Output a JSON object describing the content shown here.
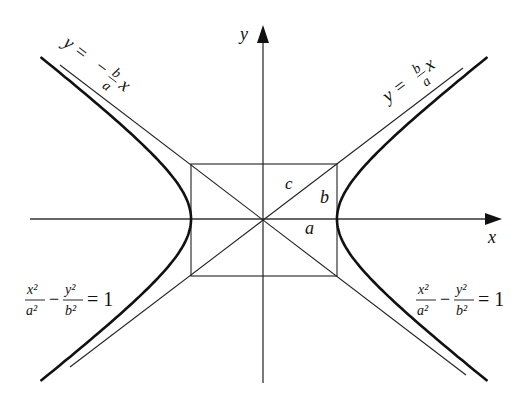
{
  "diagram": {
    "type": "hyperbola",
    "center": {
      "x": 264,
      "y": 219
    },
    "a": 73,
    "b": 56,
    "axes": {
      "x_label": "x",
      "y_label": "y"
    },
    "triangle_labels": {
      "hypotenuse": "c",
      "vertical": "b",
      "horizontal": "a"
    },
    "asymptotes": {
      "positive": {
        "lhs": "y =",
        "num": "b",
        "den": "a",
        "var": "x"
      },
      "negative": {
        "lhs": "y =",
        "sign": "−",
        "num": "b",
        "den": "a",
        "var": "x"
      }
    },
    "equations": {
      "left": {
        "x_num": "x²",
        "x_den": "a²",
        "minus": "−",
        "y_num": "y²",
        "y_den": "b²",
        "rhs": "= 1"
      },
      "right": {
        "x_num": "x²",
        "x_den": "a²",
        "minus": "−",
        "y_num": "y²",
        "y_den": "b²",
        "rhs": "= 1"
      }
    },
    "colors": {
      "curve": "#111111",
      "line": "#222222",
      "axis": "#333333"
    }
  }
}
